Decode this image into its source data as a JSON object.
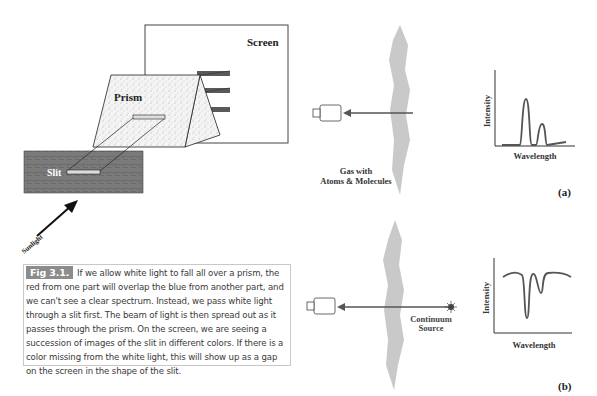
{
  "left_diagram": {
    "screen_label": "Screen",
    "prism_label": "Prism",
    "slit_label": "Slit",
    "sunlight_label": "Sunlight"
  },
  "caption": {
    "tag": "Fig 3.1.",
    "text": "If we allow white light to fall all over a prism, the red from one part will overlap the blue from another part, and we can't see a clear spectrum. Instead, we pass white light through a slit first. The beam of light is then spread out as it passes through the prism. On the screen, we are seeing a succession of images of the slit in different colors. If there is a color missing from the white light, this will show up as a gap on the screen in the shape of the slit."
  },
  "panel_a": {
    "gas_label_line1": "Gas with",
    "gas_label_line2": "Atoms &  Molecules",
    "y_axis": "Intensity",
    "x_axis": "Wavelength",
    "panel_label": "(a)"
  },
  "panel_b": {
    "source_label_line1": "Continuum",
    "source_label_line2": "Source",
    "y_axis": "Intensity",
    "x_axis": "Wavelength",
    "panel_label": "(b)"
  },
  "colors": {
    "cloud": "#c9c9c9",
    "arrow": "#555555",
    "caption_tag_bg": "#8c8c8c",
    "spectrum_bar": "#5a5a5a"
  }
}
